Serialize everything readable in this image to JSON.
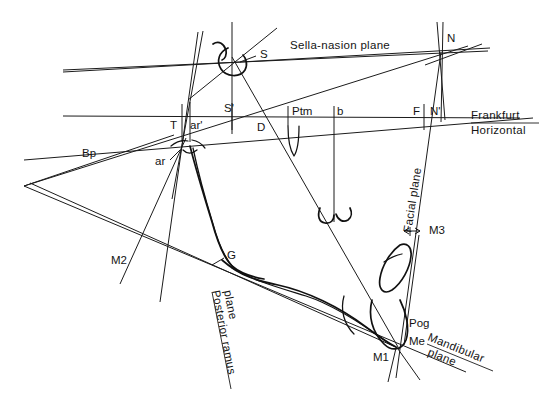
{
  "figure": {
    "type": "cephalometric-tracing-diagram",
    "background_color": "#ffffff",
    "line_color": "#1b1b1b"
  },
  "plane_labels": {
    "sella_nasion": "Sella-nasion plane",
    "frankfurt_line1": "Frankfurt",
    "frankfurt_line2": "Horizontal",
    "facial": "Facial plane",
    "mandibular_line1": "Mandibular",
    "mandibular_line2": "plane",
    "posterior_ramus_line1": "Posterior ramus",
    "posterior_ramus_line2": "plane"
  },
  "points": {
    "S": "S",
    "S_prime": "S'",
    "N": "N",
    "N_prime": "N'",
    "T": "T",
    "ar": "ar",
    "ar_prime": "ar'",
    "Bp": "Bp",
    "D": "D",
    "Ptm": "Ptm",
    "b": "b",
    "F": "F",
    "G": "G",
    "M1": "M1",
    "M2": "M2",
    "M3": "M3",
    "Pog": "Pog",
    "Me": "Me"
  }
}
